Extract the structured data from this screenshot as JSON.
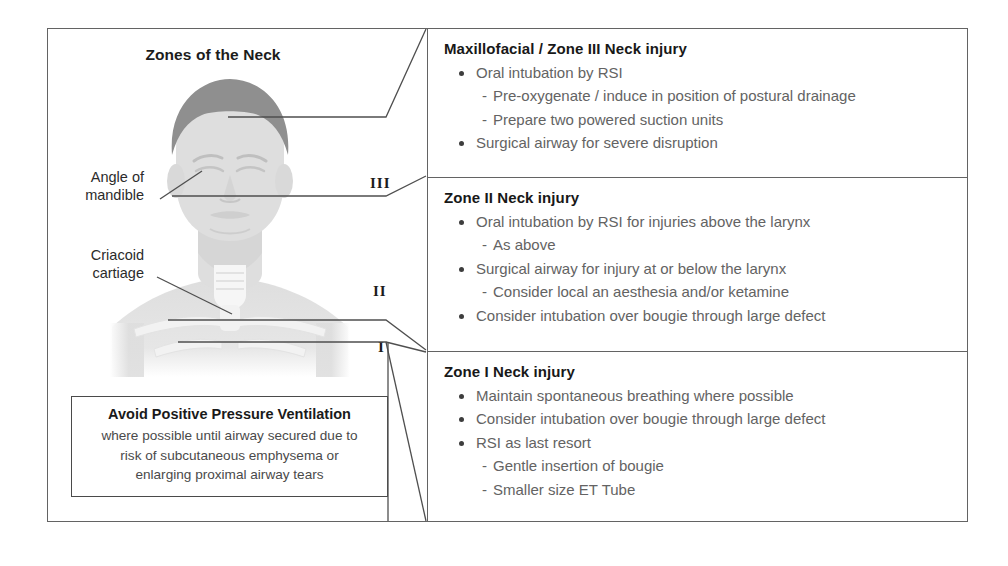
{
  "diagram": {
    "title": "Zones of the Neck",
    "anatomy_labels": [
      {
        "id": "angle-of-mandible",
        "line1": "Angle of",
        "line2": "mandible"
      },
      {
        "id": "cricoid-cartilage",
        "line1": "Criacoid",
        "line2": "cartiage"
      }
    ],
    "zone_markers": [
      {
        "id": "zone-3",
        "numeral": "III"
      },
      {
        "id": "zone-2",
        "numeral": "II"
      },
      {
        "id": "zone-1",
        "numeral": "I"
      }
    ]
  },
  "warning_box": {
    "title": "Avoid Positive Pressure Ventilation",
    "line1": "where possible until airway secured due to",
    "line2": "risk of subcutaneous emphysema or",
    "line3": "enlarging proximal airway tears"
  },
  "panels": [
    {
      "id": "zone-3-panel",
      "title": "Maxillofacial / Zone III Neck injury",
      "items": [
        {
          "level": 1,
          "text": "Oral intubation by RSI"
        },
        {
          "level": 2,
          "text": "Pre-oxygenate / induce in position of postural drainage"
        },
        {
          "level": 2,
          "text": "Prepare two powered suction units"
        },
        {
          "level": 1,
          "text": "Surgical airway for severe disruption"
        }
      ]
    },
    {
      "id": "zone-2-panel",
      "title": "Zone II Neck injury",
      "items": [
        {
          "level": 1,
          "text": "Oral intubation by RSI for injuries above the larynx"
        },
        {
          "level": 2,
          "text": "As above"
        },
        {
          "level": 1,
          "text": "Surgical airway for injury at or below the larynx"
        },
        {
          "level": 2,
          "text": "Consider local an aesthesia and/or ketamine"
        },
        {
          "level": 1,
          "text": "Consider intubation over bougie through large defect"
        }
      ]
    },
    {
      "id": "zone-1-panel",
      "title": "Zone I Neck injury",
      "items": [
        {
          "level": 1,
          "text": "Maintain spontaneous breathing where possible"
        },
        {
          "level": 1,
          "text": "Consider intubation over bougie through large defect"
        },
        {
          "level": 1,
          "text": "RSI as last resort"
        },
        {
          "level": 2,
          "text": "Gentle insertion of bougie"
        },
        {
          "level": 2,
          "text": "Smaller size ET Tube"
        }
      ]
    }
  ],
  "colors": {
    "frame": "#636363",
    "heading_text": "#181818",
    "body_text": "#636363",
    "label_text": "#2b2b2b",
    "leader_line": "#4f4f4f",
    "skin": "#dcdcdc",
    "hair": "#8f8f8f",
    "trachea": "#f4f4f4",
    "bone": "#e9e9e9"
  }
}
